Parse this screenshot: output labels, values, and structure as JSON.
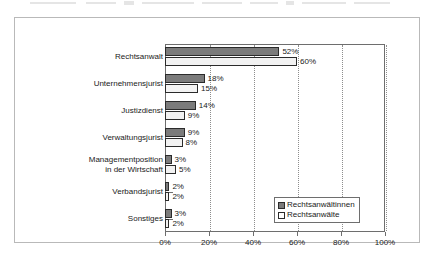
{
  "chart_data": {
    "type": "bar",
    "orientation": "horizontal",
    "title": "",
    "xlabel": "",
    "ylabel": "",
    "xlim": [
      0,
      100
    ],
    "xticks": [
      "0%",
      "20%",
      "40%",
      "60%",
      "80%",
      "100%"
    ],
    "xtick_values": [
      0,
      20,
      40,
      60,
      80,
      100
    ],
    "grid": "vertical-dotted",
    "legend_position": "inside-right-lower",
    "categories": [
      "Rechtsanwalt",
      "Unternehmensjurist",
      "Justizdienst",
      "Verwaltungsjurist",
      "Managementposition\nin der Wirtschaft",
      "Verbandsjurist",
      "Sonstiges"
    ],
    "series": [
      {
        "name": "Rechtsanwältinnen",
        "color": "#7b7b7b",
        "values": [
          52,
          18,
          14,
          9,
          3,
          2,
          3
        ],
        "labels": [
          "52%",
          "18%",
          "14%",
          "9%",
          "3%",
          "2%",
          "3%"
        ]
      },
      {
        "name": "Rechtsanwälte",
        "color": "#f2f2f2",
        "values": [
          60,
          15,
          9,
          8,
          5,
          2,
          2
        ],
        "labels": [
          "60%",
          "15%",
          "9%",
          "8%",
          "5%",
          "2%",
          "2%"
        ]
      }
    ]
  },
  "legend": {
    "items": [
      {
        "label": "Rechtsanwältinnen"
      },
      {
        "label": "Rechtsanwälte"
      }
    ]
  }
}
